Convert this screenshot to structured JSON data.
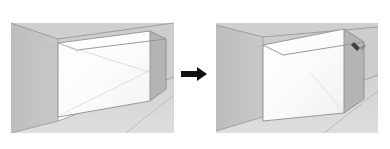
{
  "figure": {
    "name": "push-pull-extrude-step-diagram",
    "background_color": "#ffffff",
    "width": 390,
    "height": 149,
    "panel_count": 2,
    "transition_label": "→"
  },
  "palette": {
    "wall_left": "#c2c2c2",
    "wall_back": "#cfcfcf",
    "floor": "#d9d9d9",
    "box_front_face": "#fdfdfd",
    "box_top_face": "#cccccc",
    "box_side_face": "#b4b4b4",
    "outline": "#8c8c8c",
    "soft_line": "#b9b9b9",
    "arrow_color": "#111111",
    "cursor_color": "#3a3a3a",
    "page_background": "#ffffff"
  },
  "panels": [
    {
      "id": "before",
      "data_name": "panel-before",
      "caption": "",
      "scene": {
        "description": "Interior room corner with a white rectangular box volume standing on the floor",
        "box_state": "flat-face-selected",
        "has_cursor": false,
        "faces": [
          {
            "name": "left-wall",
            "fill": "#c2c2c2"
          },
          {
            "name": "back-wall",
            "fill": "#cfcfcf"
          },
          {
            "name": "floor",
            "fill": "#d9d9d9"
          },
          {
            "name": "box-front",
            "fill": "#fdfdfd"
          },
          {
            "name": "box-top",
            "fill": "#cccccc"
          },
          {
            "name": "box-right",
            "fill": "#b4b4b4"
          }
        ],
        "guide_lines": 2
      }
    },
    {
      "id": "after",
      "data_name": "panel-after",
      "caption": "",
      "scene": {
        "description": "Same room corner with the box volume extruded further toward the viewer",
        "box_state": "extruded",
        "has_cursor": true,
        "cursor": {
          "x": 141,
          "y": 29,
          "type": "pencil-cursor"
        },
        "faces": [
          {
            "name": "left-wall",
            "fill": "#c2c2c2"
          },
          {
            "name": "back-wall",
            "fill": "#cfcfcf"
          },
          {
            "name": "floor",
            "fill": "#d9d9d9"
          },
          {
            "name": "box-front",
            "fill": "#fdfdfd"
          },
          {
            "name": "box-top",
            "fill": "#cccccc"
          },
          {
            "name": "box-right",
            "fill": "#b4b4b4"
          }
        ],
        "guide_lines": 1
      }
    }
  ],
  "arrow": {
    "data_name": "step-arrow-icon",
    "direction": "right",
    "color": "#111111"
  }
}
